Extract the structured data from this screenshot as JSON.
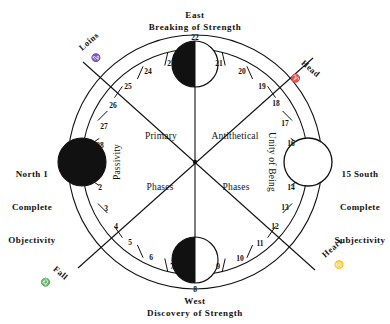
{
  "diagram": {
    "type": "circular-phase-diagram"
  },
  "cardinals": {
    "north": {
      "direction": "North",
      "phase": "1",
      "line1": "North 1",
      "line2": "Complete",
      "line3": "Objectivity"
    },
    "south": {
      "direction": "South",
      "phase": "15",
      "line1": "15 South",
      "line2": "Complete",
      "line3": "Subjectivity"
    },
    "east": {
      "direction": "East",
      "caption": "Breaking of Strength",
      "phase": "22"
    },
    "west": {
      "direction": "West",
      "caption": "Discovery of Strength",
      "phase": "8"
    }
  },
  "corners": {
    "loins": {
      "label": "Loins",
      "symbol": "♑"
    },
    "head": {
      "label": "Head",
      "symbol": "♈"
    },
    "fall": {
      "label": "Fall",
      "symbol": "♎"
    },
    "heart": {
      "label": "Heart",
      "symbol": "♋"
    }
  },
  "inner_labels": {
    "primary": "Primary",
    "antithetical": "Antithetical",
    "phases_left": "Phases",
    "phases_right": "Phases",
    "passivity": "Passivity",
    "unity_of_being": "Unity of Being"
  },
  "phase_numbers": {
    "upper_left": [
      "23",
      "24",
      "25",
      "26",
      "27",
      "28"
    ],
    "upper_right": [
      "21",
      "20",
      "19",
      "18",
      "17",
      "16"
    ],
    "lower_right": [
      "14",
      "13",
      "12",
      "11",
      "10",
      "9"
    ],
    "lower_left": [
      "2",
      "3",
      "4",
      "5",
      "6",
      "7"
    ]
  },
  "phase_markers": {
    "top": {
      "number": "22",
      "fill": "half-left-black"
    },
    "bottom": {
      "number": "8",
      "fill": "half-left-black"
    },
    "left": {
      "number": "1",
      "fill": "full-black"
    },
    "right": {
      "number": "15",
      "fill": "full-white"
    }
  },
  "colors": {
    "ink": "#111111",
    "paper": "#ffffff"
  }
}
